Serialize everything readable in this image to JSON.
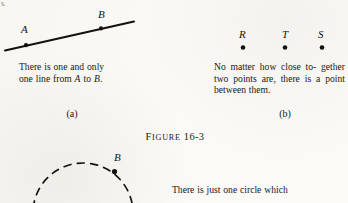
{
  "page": {
    "background_color": "#fbfaf7",
    "ink_color": "#14100d",
    "corner_fragment": "s."
  },
  "figure": {
    "label_word": "Figure",
    "label_number": "16-3",
    "subfigures": [
      {
        "tag": "(a)",
        "caption": "There is one and only one line from A to B."
      },
      {
        "tag": "(b)",
        "caption": "No matter how close together two points are, there is a point between them."
      }
    ]
  },
  "panel_a": {
    "tag": "(a)",
    "caption_line1": "There is one and only",
    "caption_line2_pre": "one line from ",
    "caption_line2_var1": "A",
    "caption_line2_mid": " to ",
    "caption_line2_var2": "B",
    "caption_line2_end": ".",
    "points": [
      {
        "label": "A",
        "x": 26,
        "y": 42,
        "label_x": 21,
        "label_y": 27
      },
      {
        "label": "B",
        "x": 101,
        "y": 28,
        "label_x": 97,
        "label_y": 12
      }
    ],
    "line": {
      "x1": 5,
      "y1": 50,
      "x2": 134,
      "y2": 22,
      "width": 1.9
    }
  },
  "panel_b": {
    "tag": "(b)",
    "caption_line1": "No matter how close to-",
    "caption_line2": "gether two points are, there",
    "caption_line3": "is a point between them.",
    "points": [
      {
        "label": "R",
        "x": 243,
        "y": 48,
        "label_x": 238,
        "label_y": 30
      },
      {
        "label": "T",
        "x": 285,
        "y": 48,
        "label_x": 281,
        "label_y": 30
      },
      {
        "label": "S",
        "x": 322,
        "y": 48,
        "label_x": 318,
        "label_y": 30
      }
    ]
  },
  "panel_c": {
    "caption_line1": "There is just one circle which",
    "points": [
      {
        "label": "B",
        "x": 114,
        "y": 170,
        "label_x": 114,
        "label_y": 153
      }
    ],
    "circle": {
      "cx": 83,
      "cy": 213,
      "r": 50,
      "dash": "7 6"
    }
  }
}
